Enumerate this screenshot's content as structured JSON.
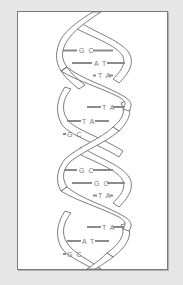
{
  "diagram": {
    "colors": {
      "background": "#e6e6e6",
      "frame_fill": "#ffffff",
      "frame_border": "#7a7a7a",
      "strand_stroke": "#6e6e6e",
      "strand_fill": "#ffffff",
      "bar": "#8a8a8a",
      "label": "#7a7a7a"
    },
    "base_pairs": [
      {
        "label": "G C",
        "pair": "GC"
      },
      {
        "label": "A T",
        "pair": "AT"
      },
      {
        "label": "T A",
        "pair": "TA"
      },
      {
        "label": "T A",
        "pair": "TA"
      },
      {
        "label": "T A",
        "pair": "TA"
      },
      {
        "label": "G C",
        "pair": "GC"
      },
      {
        "label": "G C",
        "pair": "GC"
      },
      {
        "label": "G C",
        "pair": "GC"
      },
      {
        "label": "T A",
        "pair": "TA"
      },
      {
        "label": "T A",
        "pair": "TA"
      },
      {
        "label": "A T",
        "pair": "AT"
      },
      {
        "label": "G C",
        "pair": "GC"
      }
    ]
  }
}
